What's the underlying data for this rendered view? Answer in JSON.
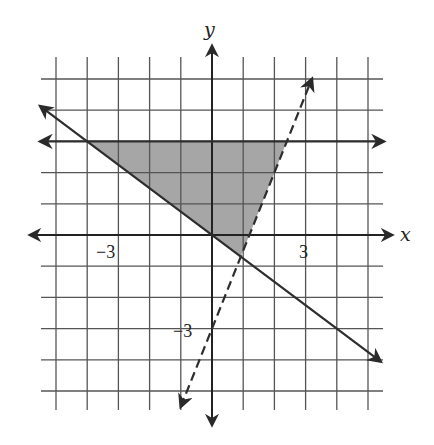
{
  "chart_data": {
    "type": "inequality-graph",
    "title": "",
    "xlabel": "x",
    "ylabel": "y",
    "xlim": [
      -5,
      5
    ],
    "ylim": [
      -5,
      5
    ],
    "grid": true,
    "grid_step": 1,
    "tick_labels": {
      "x": [
        {
          "value": -3,
          "label": "−3"
        },
        {
          "value": 3,
          "label": "3"
        }
      ],
      "y": [
        {
          "value": -3,
          "label": "−3"
        }
      ]
    },
    "lines": [
      {
        "name": "horizontal boundary",
        "equation": "y = 3",
        "style": "solid",
        "points": [
          [
            -5.5,
            3
          ],
          [
            5.5,
            3
          ]
        ],
        "arrows": "both"
      },
      {
        "name": "descending boundary",
        "equation": "y = -(3/4)x",
        "style": "solid",
        "points": [
          [
            -5.5,
            4.125
          ],
          [
            5.4,
            -4.05
          ]
        ],
        "arrows": "both"
      },
      {
        "name": "dashed boundary",
        "equation": "y = 2.5x - 3",
        "style": "dashed",
        "points": [
          [
            -1.0,
            -5.5
          ],
          [
            3.2,
            5.0
          ]
        ],
        "arrows": "both"
      }
    ],
    "shaded_region": {
      "description": "triangle bounded by y = 3, y = -(3/4)x, and the dashed line",
      "vertices": [
        [
          -4,
          3
        ],
        [
          2.4,
          3
        ],
        [
          0.92,
          -0.69
        ]
      ],
      "color": "#a6a6a6"
    }
  },
  "labels": {
    "x_axis": "x",
    "y_axis": "y",
    "x_neg3": "−3",
    "x_pos3": "3",
    "y_neg3": "−3"
  },
  "colors": {
    "grid": "#555555",
    "axis": "#222222",
    "line": "#333333",
    "shade": "#a6a6a6"
  }
}
